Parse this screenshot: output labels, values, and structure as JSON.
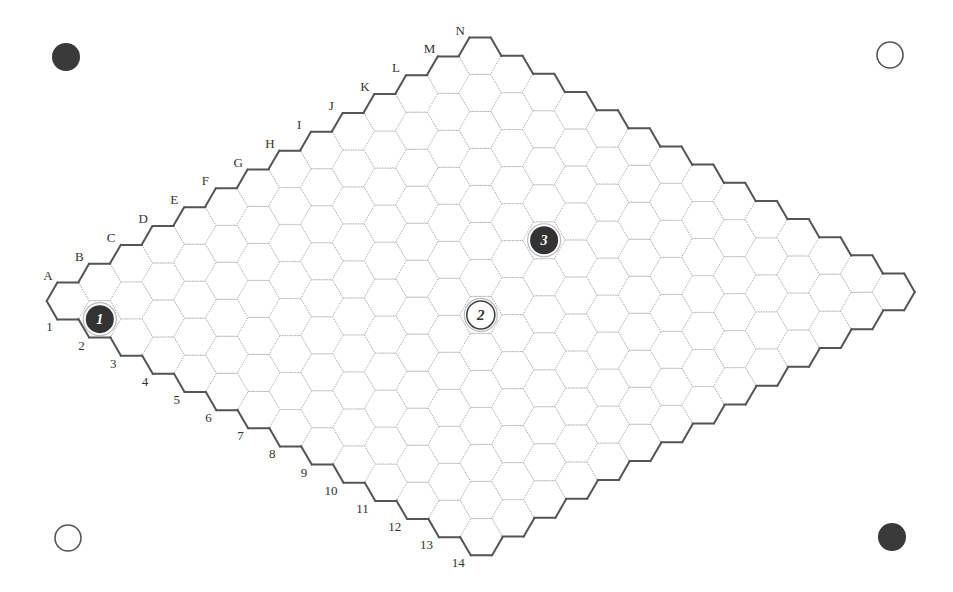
{
  "game": "Hex",
  "board": {
    "size": 14,
    "column_labels": [
      "A",
      "B",
      "C",
      "D",
      "E",
      "F",
      "G",
      "H",
      "I",
      "J",
      "K",
      "L",
      "M",
      "N"
    ],
    "row_labels": [
      "1",
      "2",
      "3",
      "4",
      "5",
      "6",
      "7",
      "8",
      "9",
      "10",
      "11",
      "12",
      "13",
      "14"
    ],
    "origin": [
      68,
      301
    ],
    "step_letter": [
      31.7,
      -18.85
    ],
    "step_number": [
      31.8,
      18.15
    ],
    "hex_radius": 21.3,
    "colors": {
      "border": "#555555",
      "grid": "#9a9a9a",
      "black_stone": "#333333",
      "white_stone": "#ffffff",
      "label": "#333333"
    }
  },
  "stones": [
    {
      "move": "1",
      "color": "black",
      "cell": "A2"
    },
    {
      "move": "2",
      "color": "white",
      "cell": "G8"
    },
    {
      "move": "3",
      "color": "black",
      "cell": "J7"
    }
  ],
  "corner_markers": [
    {
      "position": "top-left",
      "color": "black",
      "center": [
        66,
        57
      ]
    },
    {
      "position": "top-right",
      "color": "white",
      "center": [
        890,
        55
      ]
    },
    {
      "position": "bottom-left",
      "color": "white",
      "center": [
        68,
        538
      ]
    },
    {
      "position": "bottom-right",
      "color": "black",
      "center": [
        892,
        537
      ]
    }
  ]
}
